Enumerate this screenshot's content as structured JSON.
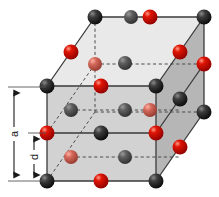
{
  "figure": {
    "type": "crystal-lattice-diagram",
    "background_color": "#ffffff"
  },
  "dimension_labels": [
    {
      "id": "a",
      "text": "a",
      "meaning": "cube edge length",
      "x": 14,
      "y_top": 87,
      "y_bottom": 181
    },
    {
      "id": "d",
      "text": "d",
      "meaning": "interplanar spacing",
      "x": 34,
      "y_top": 133,
      "y_bottom": 181
    }
  ],
  "colors": {
    "atom_dark": "#1a1a1a",
    "atom_dark_highlight": "#6e6e6e",
    "atom_dark_interior": "#4a4a4a",
    "atom_red": "#d00000",
    "atom_red_highlight": "#ff8a7a",
    "atom_red_interior": "#c9584a",
    "face_front": "#d2d2d2",
    "face_top": "#e9e9e9",
    "face_right": "#b6b6b6",
    "edge": "#3a3a3a",
    "hidden_edge": "#5a5a5a",
    "label_text": "#1a1a1a",
    "arrow": "#1a1a1a"
  },
  "geometry": {
    "front_top_left": [
      47,
      86
    ],
    "front_top_right": [
      156,
      86
    ],
    "front_bottom_left": [
      47,
      181
    ],
    "front_bottom_right": [
      156,
      181
    ],
    "back_top_left": [
      95,
      17
    ],
    "back_top_right": [
      204,
      17
    ],
    "back_bottom_left": [
      95,
      112
    ],
    "back_bottom_right": [
      204,
      112
    ],
    "depth_dx": 48,
    "depth_dy": -69,
    "edge_px": 109,
    "height_px": 95
  },
  "atoms": {
    "dark_count": 18,
    "red_count": 18,
    "dark_label": "dark sphere (cation/anion site A)",
    "red_label": "red sphere (cation/anion site B)",
    "dark": [
      {
        "x": 47,
        "y": 86,
        "r": 7.5,
        "shade": "front"
      },
      {
        "x": 156,
        "y": 86,
        "r": 7.5,
        "shade": "front"
      },
      {
        "x": 47,
        "y": 181,
        "r": 7.5,
        "shade": "front"
      },
      {
        "x": 156,
        "y": 181,
        "r": 7.5,
        "shade": "front"
      },
      {
        "x": 95,
        "y": 17,
        "r": 7.5,
        "shade": "front"
      },
      {
        "x": 204,
        "y": 17,
        "r": 7.5,
        "shade": "front"
      },
      {
        "x": 204,
        "y": 112,
        "r": 7.5,
        "shade": "front"
      },
      {
        "x": 101,
        "y": 133,
        "r": 7.5,
        "shade": "front"
      },
      {
        "x": 101,
        "y": 86,
        "r": 7.5,
        "shade": "front"
      },
      {
        "x": 150,
        "y": 52,
        "r": 7.5,
        "shade": "front"
      },
      {
        "x": 180,
        "y": 52,
        "r": 7.5,
        "shade": "front"
      },
      {
        "x": 180,
        "y": 147,
        "r": 7.5,
        "shade": "front"
      },
      {
        "x": 71,
        "y": 110,
        "r": 7.0,
        "shade": "interior"
      },
      {
        "x": 125,
        "y": 110,
        "r": 7.0,
        "shade": "interior"
      },
      {
        "x": 125,
        "y": 155,
        "r": 7.0,
        "shade": "interior"
      },
      {
        "x": 125,
        "y": 63,
        "r": 7.0,
        "shade": "interior"
      },
      {
        "x": 71,
        "y": 52,
        "r": 7.0,
        "shade": "interior"
      },
      {
        "x": 131,
        "y": 17,
        "r": 7.0,
        "shade": "interior"
      }
    ],
    "red": [
      {
        "x": 101,
        "y": 181,
        "r": 7.5,
        "shade": "front"
      },
      {
        "x": 101,
        "y": 17,
        "r": 7.5,
        "shade": "front"
      },
      {
        "x": 47,
        "y": 133,
        "r": 7.5,
        "shade": "front"
      },
      {
        "x": 156,
        "y": 133,
        "r": 7.5,
        "shade": "front"
      },
      {
        "x": 71,
        "y": 52,
        "r": 7.5,
        "shade": "front"
      },
      {
        "x": 180,
        "y": 52,
        "r": 7.5,
        "shade": "front"
      },
      {
        "x": 180,
        "y": 147,
        "r": 7.5,
        "shade": "front"
      },
      {
        "x": 204,
        "y": 64,
        "r": 7.5,
        "shade": "front"
      },
      {
        "x": 150,
        "y": 99,
        "r": 7.5,
        "shade": "front"
      },
      {
        "x": 95,
        "y": 64,
        "r": 7.0,
        "shade": "interior"
      },
      {
        "x": 71,
        "y": 157,
        "r": 7.0,
        "shade": "interior"
      },
      {
        "x": 150,
        "y": 147,
        "r": 7.0,
        "shade": "interior"
      }
    ]
  },
  "edges": {
    "solid_count": 9,
    "dashed_count": 7,
    "dashed_note": "hidden back edges and internal reference lines"
  }
}
